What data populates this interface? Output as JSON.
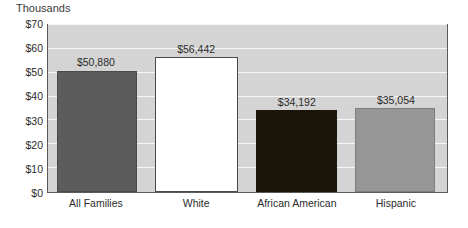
{
  "chart_data": {
    "type": "bar",
    "title": "",
    "units_title": "Thousands",
    "xlabel": "",
    "ylabel": "",
    "ylim": [
      0,
      70
    ],
    "grid": true,
    "legend": "none",
    "categories": [
      "All Families",
      "White",
      "African American",
      "Hispanic"
    ],
    "values": [
      50880,
      56442,
      34192,
      35054
    ],
    "value_labels": [
      "$50,880",
      "$56,442",
      "$34,192",
      "$35,054"
    ],
    "y_ticks": [
      0,
      10,
      20,
      30,
      40,
      50,
      60,
      70
    ],
    "y_tick_labels": [
      "$0",
      "$10",
      "$20",
      "$30",
      "$40",
      "$50",
      "$60",
      "$70"
    ],
    "series": [
      {
        "name": "Median family income",
        "values": [
          50880,
          56442,
          34192,
          35054
        ]
      }
    ],
    "bar_colors": [
      "#5c5c5c",
      "#ffffff",
      "#1a1409",
      "#969696"
    ],
    "bar_border_colors": [
      "#4a4a4a",
      "#4a4a4a",
      "#1a1409",
      "#7d7d7d"
    ],
    "plot_background": "#d4d4d4",
    "gridline_color": "#f7f7f7",
    "axis_color": "#5a5a5a",
    "text_color": "#2b2b2b"
  },
  "bars": [
    {
      "category": "All Families",
      "value_label": "$50,880",
      "value": 50880,
      "center_pct": 12.2,
      "width_pct": 20.0,
      "height_pct": 72.69,
      "color": "#5c5c5c",
      "border_color": "#4a4a4a"
    },
    {
      "category": "White",
      "value_label": "$56,442",
      "value": 56442,
      "center_pct": 37.2,
      "width_pct": 20.7,
      "height_pct": 80.63,
      "color": "#ffffff",
      "border_color": "#4a4a4a"
    },
    {
      "category": "African American",
      "value_label": "$34,192",
      "value": 34192,
      "center_pct": 62.3,
      "width_pct": 20.4,
      "height_pct": 48.85,
      "color": "#1a1409",
      "border_color": "#1a1409"
    },
    {
      "category": "Hispanic",
      "value_label": "$35,054",
      "value": 35054,
      "center_pct": 87.0,
      "width_pct": 20.0,
      "height_pct": 50.08,
      "color": "#969696",
      "border_color": "#7d7d7d"
    }
  ]
}
